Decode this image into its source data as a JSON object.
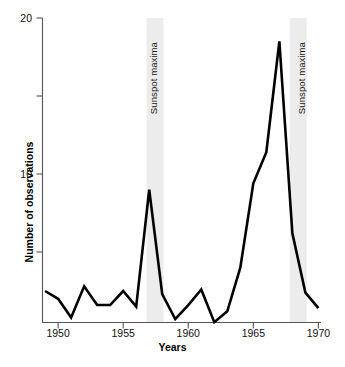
{
  "chart_data": {
    "type": "line",
    "title": "",
    "xlabel": "Years",
    "ylabel": "Number of observations",
    "xlim": [
      1948.8,
      1970.2
    ],
    "ylim": [
      0.4,
      20
    ],
    "grid": false,
    "legend": "none",
    "x_ticks": [
      1950,
      1955,
      1960,
      1965,
      1970
    ],
    "x_tick_labels": [
      "1950",
      "1955",
      "1960",
      "1965",
      "1970"
    ],
    "y_ticks": [
      5,
      10,
      15,
      20
    ],
    "y_tick_labels": [
      "",
      "10",
      "",
      "20"
    ],
    "y_labeled_ticks": [
      10,
      20
    ],
    "y_minor_ticks": [
      5,
      15
    ],
    "line_color": "#000000",
    "band_color": "#ececec",
    "series": [
      {
        "name": "Number of observations",
        "x": [
          1949,
          1950,
          1951,
          1952,
          1953,
          1954,
          1955,
          1956,
          1957,
          1958,
          1959,
          1960,
          1961,
          1962,
          1963,
          1964,
          1965,
          1966,
          1967,
          1968,
          1969,
          1970
        ],
        "values": [
          2.5,
          2.0,
          0.8,
          2.8,
          1.6,
          1.6,
          2.5,
          1.5,
          9.0,
          2.3,
          0.7,
          1.6,
          2.6,
          0.5,
          1.2,
          4.0,
          9.4,
          11.4,
          18.5,
          6.2,
          2.4,
          1.4
        ]
      }
    ],
    "annotations": [
      {
        "label": "Sunspot maxima",
        "type": "vertical-band",
        "x_start": 1956.8,
        "x_end": 1958.1,
        "rotation": -90
      },
      {
        "label": "Sunspot maxima",
        "type": "vertical-band",
        "x_start": 1967.8,
        "x_end": 1969.1,
        "rotation": -90
      }
    ]
  },
  "axes": {
    "x_title": "Years",
    "y_title": "Number of observations"
  }
}
